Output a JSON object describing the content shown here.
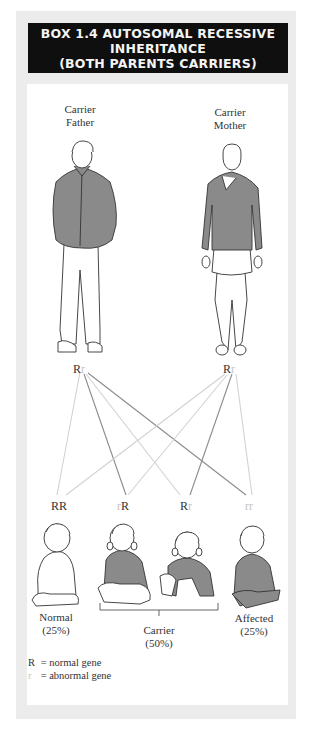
{
  "header": {
    "line1": "BOX 1.4 AUTOSOMAL RECESSIVE",
    "line2": "INHERITANCE",
    "line3": "(BOTH PARENTS CARRIERS)"
  },
  "parents": {
    "father": {
      "label1": "Carrier",
      "label2": "Father",
      "allele1": "R",
      "allele2": "r"
    },
    "mother": {
      "label1": "Carrier",
      "label2": "Mother",
      "allele1": "R",
      "allele2": "r"
    }
  },
  "children": [
    {
      "a1": "R",
      "a2": "R",
      "genotype": "RR"
    },
    {
      "a1": "r",
      "a2": "R",
      "genotype": "rR"
    },
    {
      "a1": "R",
      "a2": "r",
      "genotype": "Rr"
    },
    {
      "a1": "r",
      "a2": "r",
      "genotype": "rr"
    }
  ],
  "outcomes": {
    "normal": {
      "label": "Normal",
      "pct": "(25%)"
    },
    "carrier": {
      "label": "Carrier",
      "pct": "(50%)"
    },
    "affected": {
      "label": "Affected",
      "pct": "(25%)"
    }
  },
  "legend": {
    "r_upper": "R",
    "r_upper_desc": "= normal gene",
    "r_lower": "r",
    "r_lower_desc": "= abnormal gene"
  },
  "colors": {
    "header_bg": "#0f0f0f",
    "frame_bg": "#ececec",
    "shirt": "#8a8a8a",
    "line_dark": "#8c8c8c",
    "line_light": "#d2d2d2"
  }
}
